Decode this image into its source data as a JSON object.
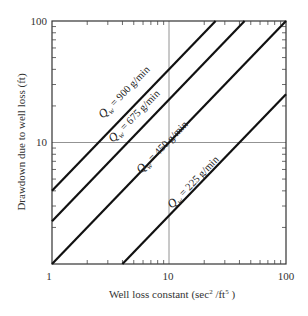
{
  "chart_data": {
    "type": "line",
    "title": "",
    "xlabel": "Well loss constant (sec²/ft⁵)",
    "ylabel": "Drawdown due to well loss (ft)",
    "xscale": "log",
    "yscale": "log",
    "xlim": [
      1,
      100
    ],
    "ylim": [
      1,
      100
    ],
    "xticks": [
      "1",
      "10",
      "100"
    ],
    "yticks": [
      "1",
      "10",
      "100"
    ],
    "grid": "major gridlines at 10 on both axes",
    "legend": "inline labels on lines",
    "series": [
      {
        "name": "Qw = 900 g/min",
        "q": "900",
        "points": [
          [
            1,
            4
          ],
          [
            25,
            100
          ]
        ]
      },
      {
        "name": "Qw = 675 g/min",
        "q": "675",
        "points": [
          [
            1,
            2.25
          ],
          [
            44.4,
            100
          ]
        ]
      },
      {
        "name": "Qw = 450 g/min",
        "q": "450",
        "points": [
          [
            1,
            1
          ],
          [
            100,
            100
          ]
        ]
      },
      {
        "name": "Qw = 225 g/min",
        "q": "225",
        "points": [
          [
            4,
            1
          ],
          [
            100,
            25
          ]
        ]
      }
    ]
  },
  "labels": {
    "x_axis": "Well loss constant (sec",
    "x_axis_sup1": "2",
    "x_axis_mid": " /ft",
    "x_axis_sup2": "5",
    "x_axis_end": " )",
    "y_axis": "Drawdown due to well loss (ft)",
    "x_tick_1": "1",
    "x_tick_10": "10",
    "x_tick_100": "100",
    "y_tick_1": "1",
    "y_tick_10": "10",
    "y_tick_100": "100",
    "q_symbol": "Q",
    "q_sub": "w",
    "l900": " = 900 g/min",
    "l675": " = 675 g/min",
    "l450": " = 450 g/min",
    "l225": " = 225 g/min"
  }
}
